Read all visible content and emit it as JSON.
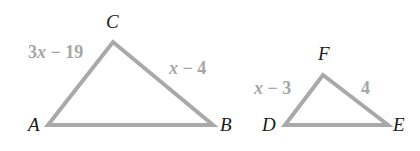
{
  "figure": {
    "colors": {
      "triangle_stroke": "#a9a9a9",
      "side_label": "#a6a6a6",
      "vertex_label": "#1a1a1a",
      "background": "#ffffff"
    },
    "triangles": [
      {
        "name": "ABC",
        "vertices": {
          "A": {
            "label": "A",
            "x": 48,
            "y": 125
          },
          "B": {
            "label": "B",
            "x": 213,
            "y": 125
          },
          "C": {
            "label": "C",
            "x": 113,
            "y": 42
          }
        },
        "sides": {
          "AC": {
            "coef": "3",
            "var": "x",
            "rest": " − 19"
          },
          "CB": {
            "coef": "",
            "var": "x",
            "rest": " − 4"
          }
        }
      },
      {
        "name": "DEF",
        "vertices": {
          "D": {
            "label": "D",
            "x": 285,
            "y": 125
          },
          "E": {
            "label": "E",
            "x": 388,
            "y": 125
          },
          "F": {
            "label": "F",
            "x": 323,
            "y": 75
          }
        },
        "sides": {
          "DF": {
            "coef": "",
            "var": "x",
            "rest": " − 3"
          },
          "FE": {
            "coef": "",
            "var": "",
            "rest": "4"
          }
        }
      }
    ]
  }
}
